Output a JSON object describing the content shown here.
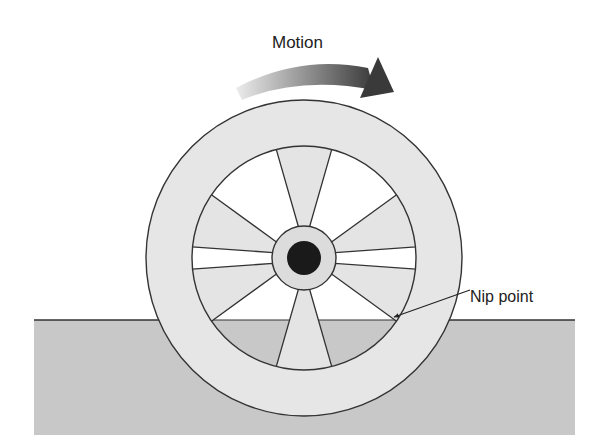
{
  "diagram": {
    "labels": {
      "motion": "Motion",
      "nip_point": "Nip point"
    },
    "wheel": {
      "spoke_count": 6,
      "spoke_angles_deg": [
        90,
        270,
        20,
        -20,
        160,
        200
      ]
    },
    "colors": {
      "background": "#ffffff",
      "ground": "#c8c8c8",
      "rim": "#e6e6e6",
      "spoke": "#e4e4e4",
      "hub": "#dcdcdc",
      "axle": "#1a1a1a",
      "stroke": "#333333",
      "arrow_start": "#ececec",
      "arrow_end": "#3a3a3a"
    }
  }
}
